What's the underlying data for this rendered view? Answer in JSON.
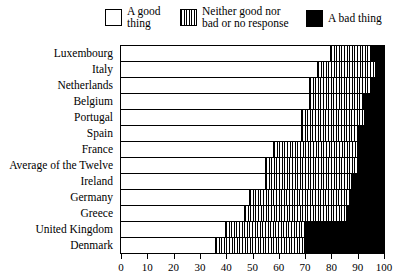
{
  "legend": {
    "items": [
      {
        "key": "good",
        "label": "A good\nthing",
        "swatch": "white-square-icon"
      },
      {
        "key": "neither",
        "label": "Neither good nor\nbad or no response",
        "swatch": "hatched-square-icon"
      },
      {
        "key": "bad",
        "label": "A bad thing",
        "swatch": "black-square-icon"
      }
    ]
  },
  "colors": {
    "good": "#ffffff",
    "neither": "#ffffff",
    "bad": "#000000",
    "line": "#000000"
  },
  "axis": {
    "ticks": [
      "0",
      "10",
      "20",
      "30",
      "40",
      "50",
      "60",
      "70",
      "80",
      "90",
      "100"
    ]
  },
  "chart_data": {
    "type": "bar",
    "orientation": "horizontal",
    "stacked": true,
    "title": "",
    "subtitle": "",
    "xlabel": "",
    "ylabel": "",
    "xlim": [
      0,
      100
    ],
    "grid": false,
    "legend_position": "top",
    "categories": [
      "Luxembourg",
      "Italy",
      "Netherlands",
      "Belgium",
      "Portugal",
      "Spain",
      "France",
      "Average of the Twelve",
      "Ireland",
      "Germany",
      "Greece",
      "United Kingdom",
      "Denmark"
    ],
    "series": [
      {
        "name": "A good thing",
        "values": [
          80,
          75,
          72,
          72,
          69,
          69,
          58,
          55,
          55,
          49,
          47,
          40,
          36
        ]
      },
      {
        "name": "Neither good nor bad or no response",
        "values": [
          15,
          22,
          23,
          20,
          24,
          21,
          32,
          35,
          33,
          38,
          39,
          30,
          34
        ]
      },
      {
        "name": "A bad thing",
        "values": [
          5,
          3,
          5,
          8,
          7,
          10,
          10,
          10,
          12,
          13,
          14,
          30,
          30
        ]
      }
    ]
  }
}
